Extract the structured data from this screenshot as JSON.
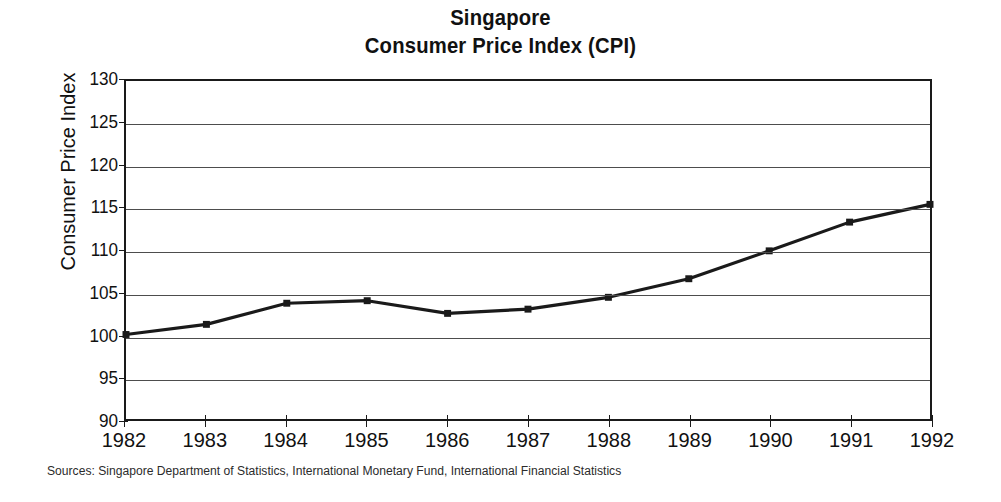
{
  "title": {
    "line1": "Singapore",
    "line2": "Consumer Price Index (CPI)"
  },
  "source_note": "Sources: Singapore Department of Statistics, International Monetary Fund, International Financial Statistics",
  "chart_data": {
    "type": "line",
    "title": "Singapore Consumer Price Index (CPI)",
    "xlabel": "",
    "ylabel": "Consumer Price Index",
    "x": [
      1982,
      1983,
      1984,
      1985,
      1986,
      1987,
      1988,
      1989,
      1990,
      1991,
      1992
    ],
    "x_tick_labels": [
      "1982",
      "1983",
      "1984",
      "1985",
      "1986",
      "1987",
      "1988",
      "1989",
      "1990",
      "1991",
      "1992"
    ],
    "values": [
      100.0,
      101.2,
      103.7,
      104.0,
      102.5,
      103.0,
      104.4,
      106.6,
      109.9,
      113.3,
      115.4
    ],
    "y_tick_labels": [
      "130",
      "125",
      "120",
      "115",
      "110",
      "105",
      "100",
      "95",
      "90"
    ],
    "y_ticks": [
      130,
      125,
      120,
      115,
      110,
      105,
      100,
      95,
      90
    ],
    "ylim": [
      90,
      130
    ],
    "xlim": [
      1982,
      1992
    ],
    "grid": true,
    "legend": "none",
    "series_color": "#1a1a1a",
    "grid_color": "#4d4d4d",
    "marker": "square"
  }
}
